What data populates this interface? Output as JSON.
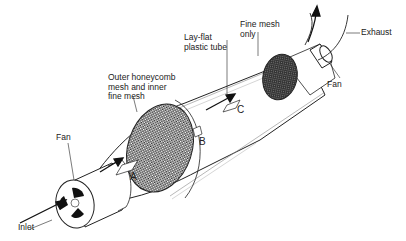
{
  "diagram": {
    "type": "technical-illustration",
    "labels": {
      "inlet": "Inlet",
      "fan_inlet": "Fan",
      "outer_mesh": "Outer honeycomb\nmesh and inner\nfine mesh",
      "tube": "Lay-flat\nplastic tube",
      "fine_mesh": "Fine mesh\nonly",
      "fan_outlet": "Fan",
      "exhaust": "Exhaust",
      "point_a": "A",
      "point_b": "B",
      "point_c": "C"
    },
    "colors": {
      "line": "#222222",
      "mesh_dark": "#2a2a2a",
      "mesh_light": "#ffffff",
      "background": "#ffffff"
    }
  }
}
